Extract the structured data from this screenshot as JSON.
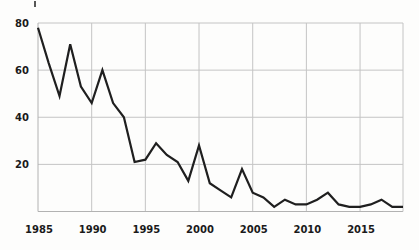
{
  "figure": {
    "background": "#fdfdfc",
    "grid_color": "#c4c4c4",
    "axis_color": "#b2b2b2",
    "line_color": "#1f1f1f",
    "label_color": "#1a1a1a"
  },
  "chart_data": {
    "type": "line",
    "title": "",
    "xlabel": "",
    "ylabel": "",
    "x": [
      1985,
      1986,
      1987,
      1988,
      1989,
      1990,
      1991,
      1992,
      1993,
      1994,
      1995,
      1996,
      1997,
      1998,
      1999,
      2000,
      2001,
      2002,
      2003,
      2004,
      2005,
      2006,
      2007,
      2008,
      2009,
      2010,
      2011,
      2012,
      2013,
      2014,
      2015,
      2016,
      2017,
      2018,
      2019
    ],
    "values": [
      78,
      63,
      49,
      71,
      53,
      46,
      60,
      46,
      40,
      21,
      22,
      29,
      24,
      21,
      13,
      28,
      12,
      9,
      6,
      18,
      8,
      6,
      2,
      5,
      3,
      3,
      5,
      8,
      3,
      2,
      2,
      3,
      5,
      2,
      2
    ],
    "xlim": [
      1985,
      2019
    ],
    "ylim": [
      0,
      80
    ],
    "x_ticks": [
      1985,
      1990,
      1995,
      2000,
      2005,
      2010,
      2015
    ],
    "y_ticks": [
      20,
      40,
      60,
      80
    ],
    "grid": true,
    "legend": false
  }
}
